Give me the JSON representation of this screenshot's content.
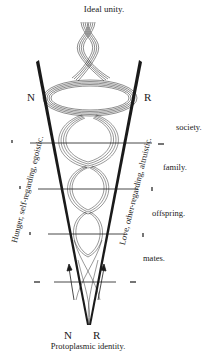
{
  "diagram": {
    "top_label": "Ideal unity.",
    "bottom_label": "Protoplasmic identity.",
    "pole_left_top": "N",
    "pole_right_top": "R",
    "pole_left_bottom": "N",
    "pole_right_bottom": "R",
    "left_axis_label": "Hunger, self-regarding, egoistic.",
    "right_axis_label": "Love, other-regarding, altruistic.",
    "levels": [
      {
        "label": "society."
      },
      {
        "label": "family."
      },
      {
        "label": "offspring."
      },
      {
        "label": "mates."
      }
    ],
    "colors": {
      "ink": "#1a1a1a",
      "background": "#ffffff"
    }
  }
}
